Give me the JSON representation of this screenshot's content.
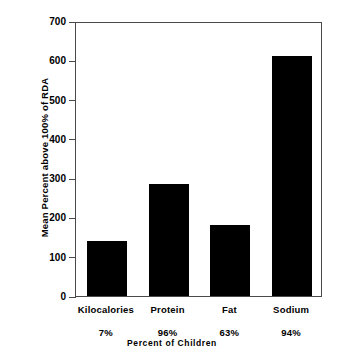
{
  "chart_data": {
    "type": "bar",
    "title": "",
    "categories": [
      "Kilocalories",
      "Protein",
      "Fat",
      "Sodium"
    ],
    "values": [
      140,
      285,
      180,
      610
    ],
    "category_sublabels": [
      "7%",
      "96%",
      "63%",
      "94%"
    ],
    "xlabel": "Percent of Children",
    "ylabel": "Mean Percent above 100% of RDA",
    "ylim": [
      0,
      700
    ],
    "yticks": [
      0,
      100,
      200,
      300,
      400,
      500,
      600,
      700
    ],
    "ytick_labels": [
      "0",
      "100",
      "200",
      "300",
      "400",
      "500",
      "600",
      "700"
    ],
    "grid": false,
    "legend": null,
    "bar_color": "#000000",
    "axis_color": "#4a4a4a",
    "background_color": "#ffffff"
  }
}
